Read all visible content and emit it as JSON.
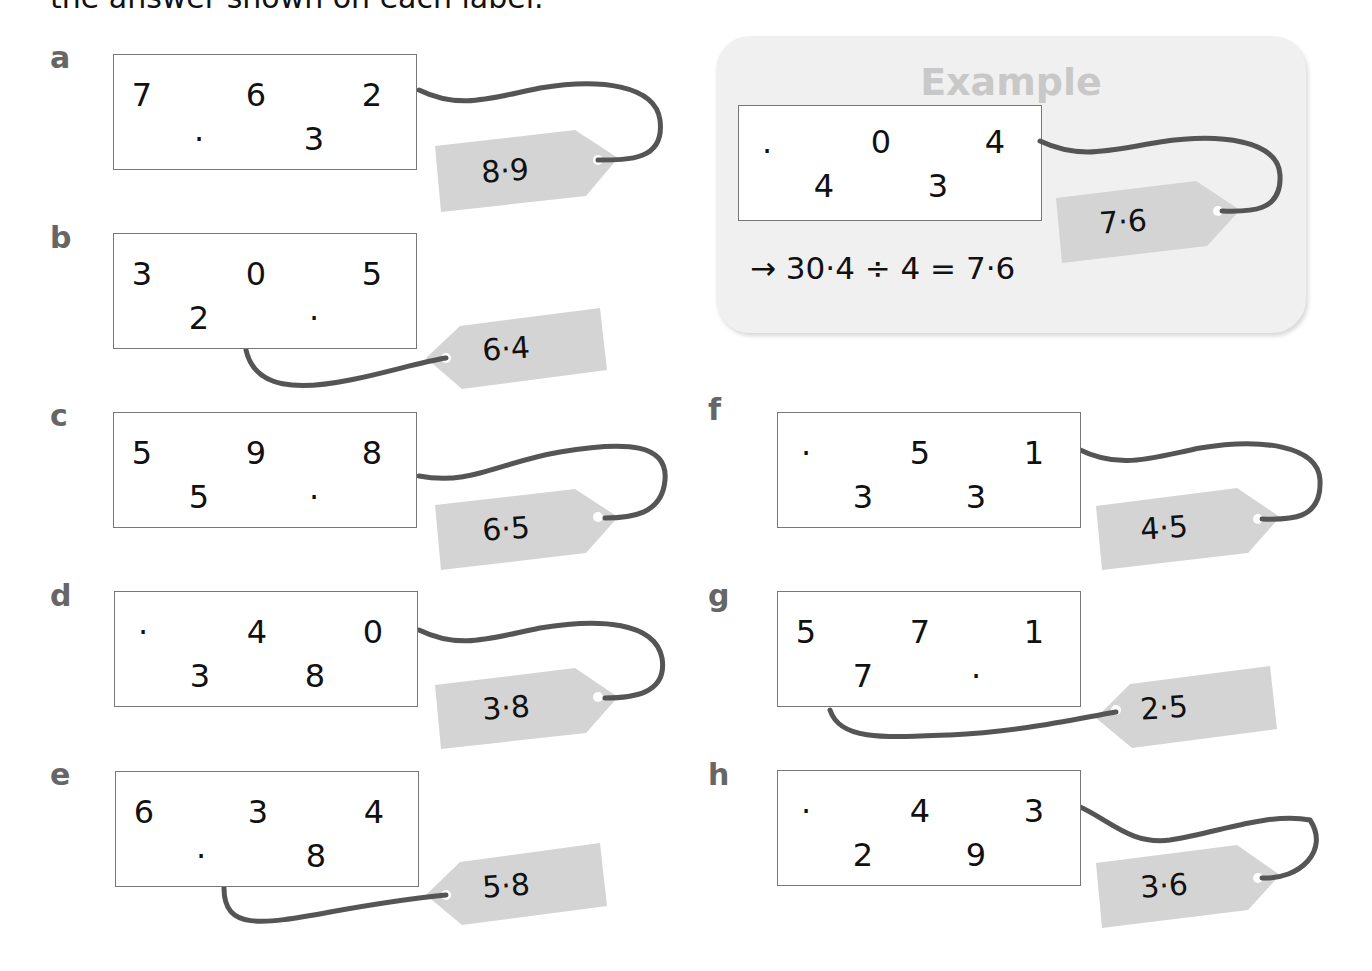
{
  "instruction": "the answer shown on each label.",
  "example": {
    "title": "Example",
    "cells": [
      ".",
      "0",
      "4",
      "4",
      "3"
    ],
    "tag": "7·6",
    "equation": "→ 30·4 ÷ 4 = 7·6"
  },
  "problems": [
    {
      "letter": "a",
      "cells": [
        "7",
        "6",
        "2",
        "·",
        "3"
      ],
      "tag": "8·9"
    },
    {
      "letter": "b",
      "cells": [
        "3",
        "0",
        "5",
        "2",
        "·"
      ],
      "tag": "6·4"
    },
    {
      "letter": "c",
      "cells": [
        "5",
        "9",
        "8",
        "5",
        "·"
      ],
      "tag": "6·5"
    },
    {
      "letter": "d",
      "cells": [
        "·",
        "4",
        "0",
        "3",
        "8"
      ],
      "tag": "3·8"
    },
    {
      "letter": "e",
      "cells": [
        "6",
        "3",
        "4",
        "·",
        "8"
      ],
      "tag": "5·8"
    },
    {
      "letter": "f",
      "cells": [
        "·",
        "5",
        "1",
        "3",
        "3"
      ],
      "tag": "4·5"
    },
    {
      "letter": "g",
      "cells": [
        "5",
        "7",
        "1",
        "7",
        "·"
      ],
      "tag": "2·5"
    },
    {
      "letter": "h",
      "cells": [
        "·",
        "4",
        "3",
        "2",
        "9"
      ],
      "tag": "3·6"
    }
  ],
  "colors": {
    "tag_fill": "#d4d4d4",
    "string": "#555555",
    "letter": "#666666",
    "example_bg": "#f0f0f0",
    "example_title": "#c8c8c8"
  }
}
